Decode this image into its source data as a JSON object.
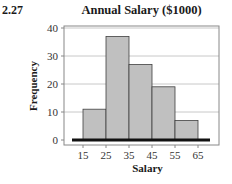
{
  "problem_number": "2.27",
  "chart_data": {
    "type": "bar",
    "subtype": "histogram",
    "title": "Annual Salary ($1000)",
    "xlabel": "Salary",
    "ylabel": "Frequency",
    "bin_edges": [
      15,
      25,
      35,
      45,
      55,
      65
    ],
    "categories": [
      "15-25",
      "25-35",
      "35-45",
      "45-55",
      "55-65"
    ],
    "values": [
      11,
      37,
      27,
      19,
      7
    ],
    "xticks": [
      "15",
      "25",
      "35",
      "45",
      "55",
      "65"
    ],
    "yticks": [
      "0",
      "10",
      "20",
      "30",
      "40"
    ],
    "ylim": [
      0,
      40
    ],
    "xlim": [
      10,
      70
    ],
    "grid": "horizontal",
    "legend": "none",
    "colors": {
      "bar_fill": "#c0c0c0",
      "bar_stroke": "#404040",
      "grid": "#c8c8c8",
      "baseline": "#111111",
      "frame": "#888888"
    }
  }
}
